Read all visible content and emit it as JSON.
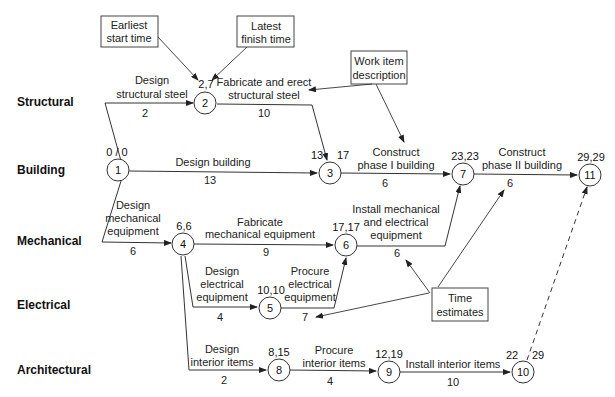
{
  "lanes": [
    "Structural",
    "Building",
    "Mechanical",
    "Electrical",
    "Architectural"
  ],
  "nodes": [
    {
      "id": "1",
      "times": "0 / 0"
    },
    {
      "id": "2",
      "times": "2,7"
    },
    {
      "id": "3",
      "times_left": "13",
      "times_right": "17"
    },
    {
      "id": "4",
      "times": "6,6"
    },
    {
      "id": "5",
      "times": "10,10"
    },
    {
      "id": "6",
      "times": "17,17"
    },
    {
      "id": "7",
      "times": "23,23"
    },
    {
      "id": "8",
      "times": "8,15"
    },
    {
      "id": "9",
      "times": "12,19"
    },
    {
      "id": "10",
      "times_left": "22",
      "times_right": "29"
    },
    {
      "id": "11",
      "times": "29,29"
    }
  ],
  "activities": [
    {
      "from": "1",
      "to": "2",
      "desc": [
        "Design",
        "structural steel"
      ],
      "duration": "2"
    },
    {
      "from": "2",
      "to": "3",
      "desc": [
        "Fabricate and erect",
        "structural steel"
      ],
      "duration": "10"
    },
    {
      "from": "1",
      "to": "3",
      "desc": [
        "Design building"
      ],
      "duration": "13"
    },
    {
      "from": "3",
      "to": "7",
      "desc": [
        "Construct",
        "phase I building"
      ],
      "duration": "6"
    },
    {
      "from": "7",
      "to": "11",
      "desc": [
        "Construct",
        "phase II building"
      ],
      "duration": "6"
    },
    {
      "from": "1",
      "to": "4",
      "desc": [
        "Design",
        "mechanical",
        "equipment"
      ],
      "duration": "6"
    },
    {
      "from": "4",
      "to": "6",
      "desc": [
        "Fabricate",
        "mechanical equipment"
      ],
      "duration": "9"
    },
    {
      "from": "6",
      "to": "7",
      "desc": [
        "Install mechanical",
        "and electrical",
        "equipment"
      ],
      "duration": "6"
    },
    {
      "from": "4",
      "to": "5",
      "desc": [
        "Design",
        "electrical",
        "equipment"
      ],
      "duration": "4"
    },
    {
      "from": "5",
      "to": "6",
      "desc": [
        "Procure",
        "electrical",
        "equipment"
      ],
      "duration": "7"
    },
    {
      "from": "4",
      "to": "8",
      "desc": [
        "Design",
        "interior items"
      ],
      "duration": "2"
    },
    {
      "from": "8",
      "to": "9",
      "desc": [
        "Procure",
        "interior items"
      ],
      "duration": "4"
    },
    {
      "from": "9",
      "to": "10",
      "desc": [
        "Install interior items"
      ],
      "duration": "10"
    },
    {
      "from": "10",
      "to": "11",
      "desc": [],
      "duration": "",
      "dummy": true
    }
  ],
  "callouts": {
    "earliest_start": [
      "Earliest",
      "start time"
    ],
    "latest_finish": [
      "Latest",
      "finish time"
    ],
    "work_item": [
      "Work item",
      "description"
    ],
    "time_estimates": [
      "Time",
      "estimates"
    ]
  }
}
